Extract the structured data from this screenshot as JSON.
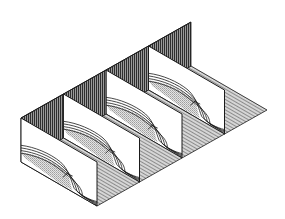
{
  "figure": {
    "type": "isometric serial cross-section block diagram",
    "section_count": 4,
    "colors": {
      "background": "#ffffff",
      "outline": "#1a1a1a",
      "back_wall_hatch": "#3a3a3a",
      "floor_hatch": "#8a8a8a",
      "layer_fill_stipple": "#bdbdbd"
    },
    "labels": []
  }
}
